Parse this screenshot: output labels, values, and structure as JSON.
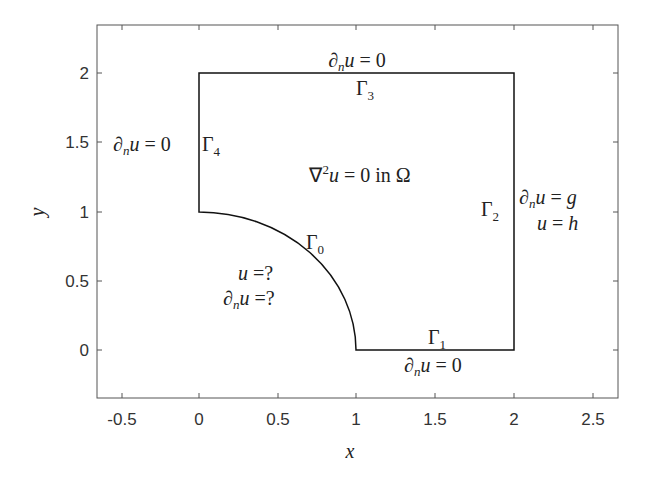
{
  "figure": {
    "type": "domain-diagram",
    "x_axis": {
      "label": "x",
      "ticks": [
        "-0.5",
        "0",
        "0.5",
        "1",
        "1.5",
        "2",
        "2.5"
      ],
      "tick_values": [
        -0.5,
        0,
        0.5,
        1,
        1.5,
        2,
        2.5
      ],
      "range": [
        -0.65,
        2.65
      ]
    },
    "y_axis": {
      "label": "y",
      "ticks": [
        "0",
        "0.5",
        "1",
        "1.5",
        "2"
      ],
      "tick_values": [
        0,
        0.5,
        1,
        1.5,
        2
      ],
      "range": [
        -0.35,
        2.35
      ]
    },
    "domain_equation": "∇²u = 0 in Ω",
    "boundaries": [
      {
        "id": "Gamma0",
        "label": "Γ0",
        "condition_1": "u =?",
        "condition_2": "∂nu =?",
        "shape": "quarter-circle arc from (0,1) to (1,0)"
      },
      {
        "id": "Gamma1",
        "label": "Γ1",
        "condition": "∂nu = 0",
        "shape": "segment (1,0)-(2,0)"
      },
      {
        "id": "Gamma2",
        "label": "Γ2",
        "condition_1": "∂nu = g",
        "condition_2": "u = h",
        "shape": "segment (2,0)-(2,2)"
      },
      {
        "id": "Gamma3",
        "label": "Γ3",
        "condition": "∂nu = 0",
        "shape": "segment (2,2)-(0,2)"
      },
      {
        "id": "Gamma4",
        "label": "Γ4",
        "condition": "∂nu = 0",
        "shape": "segment (0,2)-(0,1)"
      }
    ],
    "colors": {
      "axes": "#555555",
      "boundary": "#111111",
      "text": "#222222",
      "background": "#ffffff"
    }
  }
}
